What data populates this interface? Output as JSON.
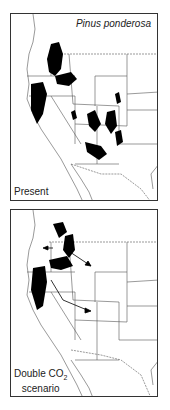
{
  "figure": {
    "species": "Pinus ponderosa",
    "panels": [
      {
        "id": "present",
        "label": "Present"
      },
      {
        "id": "double-co2",
        "label_line1": "Double CO",
        "label_sub": "2",
        "label_line2": "scenario"
      }
    ],
    "colors": {
      "range": "#000000",
      "border": "#333333",
      "state_lines": "#555555"
    }
  }
}
